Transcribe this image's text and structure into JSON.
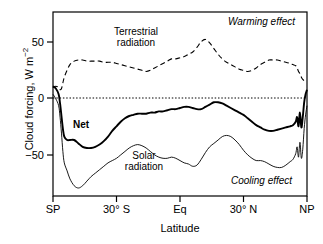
{
  "chart_data": {
    "type": "line",
    "title": "",
    "xlabel": "Latitude",
    "ylabel": "Cloud forcing, W m-2",
    "ylabel_main": "Cloud forcing, W m",
    "ylabel_exponent": "-2",
    "xlim": [
      -90,
      90
    ],
    "ylim": [
      -87,
      74
    ],
    "grid": false,
    "legend_position": "inline-annotations",
    "yticks": [
      50,
      0,
      -50
    ],
    "ytick_labels": [
      "50",
      "0",
      "-50"
    ],
    "xticks": [
      -90,
      -45,
      0,
      45,
      90
    ],
    "xtick_labels": [
      "SP",
      "30° S",
      "Eq",
      "30° N",
      "NP"
    ],
    "zero_line": 0,
    "x": [
      -90,
      -88,
      -86,
      -85,
      -84,
      -83,
      -82,
      -80,
      -78,
      -75,
      -72,
      -69,
      -66,
      -63,
      -60,
      -57,
      -54,
      -51,
      -48,
      -45,
      -42,
      -39,
      -36,
      -33,
      -30,
      -27,
      -24,
      -21,
      -18,
      -15,
      -12,
      -9,
      -6,
      -3,
      0,
      3,
      6,
      9,
      12,
      15,
      18,
      21,
      24,
      27,
      30,
      33,
      36,
      39,
      42,
      45,
      48,
      51,
      54,
      57,
      60,
      63,
      66,
      69,
      72,
      75,
      78,
      80,
      82,
      83,
      84,
      85,
      86,
      87,
      88,
      89,
      90
    ],
    "series": [
      {
        "name": "Terrestrial radiation",
        "style": "dashed",
        "color": "#000000",
        "values": [
          8,
          9,
          8,
          6,
          7,
          12,
          17,
          23,
          28,
          31,
          32,
          32,
          31,
          31,
          31,
          31,
          30,
          30,
          30,
          29,
          28,
          27,
          26,
          25,
          24,
          23,
          22,
          23,
          25,
          27,
          29,
          31,
          33,
          33,
          34,
          35,
          37,
          39,
          43,
          48,
          50,
          47,
          42,
          37,
          33,
          30,
          28,
          26,
          24,
          23,
          22,
          23,
          25,
          28,
          30,
          32,
          32,
          32,
          31,
          30,
          29,
          28,
          27,
          25,
          22,
          20,
          17,
          15,
          14,
          14,
          14
        ]
      },
      {
        "name": "Net",
        "style": "solid-thick",
        "color": "#000000",
        "values": [
          9,
          7,
          2,
          -6,
          -17,
          -28,
          -35,
          -38,
          -38,
          -38,
          -41,
          -44,
          -45,
          -45,
          -44,
          -42,
          -39,
          -35,
          -30,
          -26,
          -22,
          -19,
          -17,
          -16,
          -15,
          -15,
          -15,
          -14,
          -14,
          -13,
          -13,
          -12,
          -11,
          -11,
          -10,
          -9,
          -9,
          -10,
          -11,
          -11,
          -9,
          -7,
          -5,
          -5,
          -6,
          -8,
          -10,
          -12,
          -14,
          -16,
          -19,
          -22,
          -25,
          -27,
          -29,
          -30,
          -30,
          -29,
          -28,
          -27,
          -26,
          -25,
          -22,
          -18,
          -26,
          -14,
          -27,
          -18,
          -5,
          2,
          6
        ]
      },
      {
        "name": "Solar radiation",
        "style": "solid-thin",
        "color": "#000000",
        "values": [
          2,
          -2,
          -8,
          -18,
          -32,
          -48,
          -58,
          -65,
          -72,
          -78,
          -80,
          -78,
          -74,
          -70,
          -67,
          -64,
          -61,
          -58,
          -56,
          -54,
          -51,
          -48,
          -45,
          -43,
          -42,
          -43,
          -45,
          -48,
          -51,
          -53,
          -54,
          -54,
          -53,
          -54,
          -56,
          -58,
          -59,
          -61,
          -60,
          -55,
          -49,
          -44,
          -41,
          -38,
          -35,
          -34,
          -35,
          -38,
          -42,
          -47,
          -51,
          -54,
          -56,
          -56,
          -57,
          -59,
          -61,
          -62,
          -62,
          -60,
          -57,
          -55,
          -50,
          -44,
          -53,
          -40,
          -54,
          -46,
          -28,
          -16,
          -8
        ]
      }
    ],
    "annotations": [
      {
        "name": "terrestrial-radiation-label",
        "text_line1": "Terrestrial",
        "text_line2": "radiation",
        "style": "plain"
      },
      {
        "name": "net-label",
        "text": "Net",
        "style": "bold"
      },
      {
        "name": "solar-radiation-label",
        "text_line1": "Solar",
        "text_line2": "radiation",
        "style": "plain"
      },
      {
        "name": "warming-effect-label",
        "text": "Warming effect",
        "style": "italic"
      },
      {
        "name": "cooling-effect-label",
        "text": "Cooling effect",
        "style": "italic"
      }
    ]
  },
  "labels": {
    "y_title_main": "Cloud forcing, W m",
    "y_title_exp": "−2",
    "x_title": "Latitude",
    "ytick_50": "50",
    "ytick_0": "0",
    "ytick_neg50": "−50",
    "xtick_sp": "SP",
    "xtick_30s": "30° S",
    "xtick_eq": "Eq",
    "xtick_30n": "30° N",
    "xtick_np": "NP",
    "terrestrial_line1": "Terrestrial",
    "terrestrial_line2": "radiation",
    "net": "Net",
    "solar_line1": "Solar",
    "solar_line2": "radiation",
    "warming": "Warming effect",
    "cooling": "Cooling effect"
  }
}
